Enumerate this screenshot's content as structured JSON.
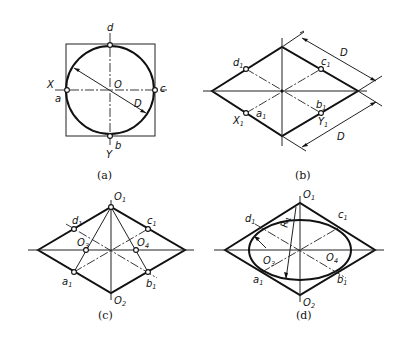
{
  "figure": {
    "panels": [
      {
        "id": "a",
        "caption": "(a)",
        "labels": {
          "d": "d",
          "X": "X",
          "a": "a",
          "O": "O",
          "c": "c",
          "D": "D",
          "b": "b",
          "Y": "Y"
        }
      },
      {
        "id": "b",
        "caption": "(b)",
        "labels": {
          "d1": "d",
          "c1": "c",
          "X1": "X",
          "a1": "a",
          "b1": "b",
          "Y1": "Y",
          "D_top": "D",
          "D_bottom": "D",
          "sub": "1"
        }
      },
      {
        "id": "c",
        "caption": "(c)",
        "labels": {
          "O1": "O",
          "O2": "O",
          "O3": "O",
          "O4": "O",
          "d1": "d",
          "c1": "c",
          "a1": "a",
          "b1": "b",
          "sub1": "1",
          "sub2": "2",
          "sub3": "3",
          "sub4": "4"
        }
      },
      {
        "id": "d",
        "caption": "(d)",
        "labels": {
          "O1": "O",
          "O2": "O",
          "O3": "O",
          "O4": "O",
          "d1": "d",
          "c1": "c",
          "a1": "a",
          "b1": "b",
          "R1": "R",
          "sub1": "1",
          "sub2": "2",
          "sub3": "3",
          "sub4": "4"
        }
      }
    ]
  }
}
